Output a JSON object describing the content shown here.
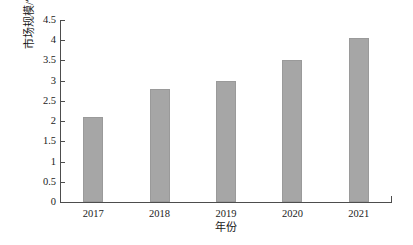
{
  "chart_data": {
    "type": "bar",
    "title": "",
    "xlabel": "年份",
    "ylabel": "市场规模/亿美元",
    "categories": [
      "2017",
      "2018",
      "2019",
      "2020",
      "2021"
    ],
    "values": [
      2.1,
      2.8,
      3.0,
      3.5,
      4.05
    ],
    "series": [
      {
        "name": "市场规模",
        "values": [
          2.1,
          2.8,
          3.0,
          3.5,
          4.05
        ]
      }
    ],
    "ylim": [
      0,
      4.5
    ],
    "ytick_labels": [
      "0",
      "0.5",
      "1",
      "1.5",
      "2",
      "2.5",
      "3",
      "3.5",
      "4",
      "4.5"
    ],
    "ytick_values": [
      0,
      0.5,
      1,
      1.5,
      2,
      2.5,
      3,
      3.5,
      4,
      4.5
    ],
    "xtick_labels": [
      "2017",
      "2018",
      "2019",
      "2020",
      "2021"
    ],
    "grid": false,
    "legend": false,
    "legend_position": "none",
    "bar_color": "#a6a6a6",
    "axis_color": "#4d4d4d",
    "background_color": "#ffffff",
    "annotations": []
  }
}
